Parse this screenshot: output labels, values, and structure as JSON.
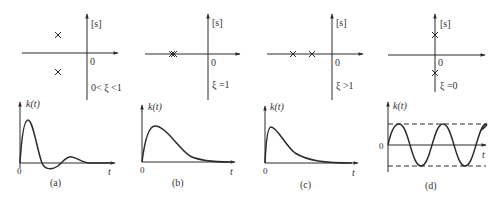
{
  "figure": {
    "panels": [
      {
        "id": "a",
        "caption": "(a)",
        "condition": "0< ξ <1",
        "plane_label": "[s]",
        "origin_label": "0",
        "poles": "complex conjugate pair in left half-plane",
        "response_label": "k(t)",
        "time_label": "t",
        "response_origin": "0",
        "response_type": "damped oscillation"
      },
      {
        "id": "b",
        "caption": "(b)",
        "condition": "ξ =1",
        "plane_label": "[s]",
        "origin_label": "0",
        "poles": "double real pole on negative real axis",
        "response_label": "k(t)",
        "time_label": "t",
        "response_origin": "0",
        "response_type": "critically damped pulse"
      },
      {
        "id": "c",
        "caption": "(c)",
        "condition": "ξ >1",
        "plane_label": "[s]",
        "origin_label": "0",
        "poles": "two distinct real poles on negative real axis",
        "response_label": "k(t)",
        "time_label": "t",
        "response_origin": "0",
        "response_type": "overdamped pulse"
      },
      {
        "id": "d",
        "caption": "(d)",
        "condition": "ξ =0",
        "plane_label": "[s]",
        "origin_label": "0",
        "poles": "pure imaginary conjugate pair",
        "response_label": "k(t)",
        "time_label": "t",
        "response_origin": "0",
        "response_type": "undamped sinusoid with dashed amplitude bounds"
      }
    ]
  },
  "colors": {
    "stroke": "#2a2a2a",
    "text": "#333333",
    "background": "#ffffff"
  }
}
